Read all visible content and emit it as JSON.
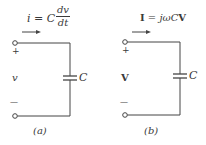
{
  "figure": {
    "panel_a": {
      "equation_lhs": "i = C",
      "equation_num": "dv",
      "equation_den": "dt",
      "plus": "+",
      "voltage": "v",
      "minus": "—",
      "cap_label": "C",
      "caption": "(a)"
    },
    "panel_b": {
      "equation": "I = jωCV",
      "equation_I": "I",
      "equation_mid": " = jωC",
      "equation_V": "V",
      "plus": "+",
      "voltage": "V",
      "minus": "—",
      "cap_label": "C",
      "caption": "(b)"
    },
    "colors": {
      "ink": "#3a3a3a",
      "background": "#ffffff"
    }
  }
}
